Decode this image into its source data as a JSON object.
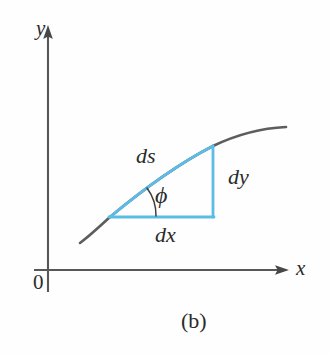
{
  "figure": {
    "caption": "(b)",
    "axes": {
      "y_label": "y",
      "x_label": "x",
      "origin_label": "0",
      "axis_color": "#555555"
    },
    "labels": {
      "arc_length": "ds",
      "delta_y": "dy",
      "delta_x": "dx",
      "angle": "ϕ"
    },
    "colors": {
      "triangle": "#5BBDE6",
      "curve": "#565656",
      "text": "#2b2b2b",
      "background": "#fefefe"
    },
    "geometry": {
      "y_axis_x": 48,
      "y_axis_top": 28,
      "y_axis_bottom": 292,
      "x_axis_y": 270,
      "x_axis_left": 34,
      "x_axis_right": 288,
      "triangle_left_vertex": [
        110,
        217
      ],
      "triangle_right_vertex": [
        213,
        217
      ],
      "triangle_top_vertex": [
        213,
        146
      ],
      "curve_start": [
        80,
        243
      ],
      "curve_end": [
        286,
        128
      ],
      "angle_arc_radius": 46
    }
  }
}
